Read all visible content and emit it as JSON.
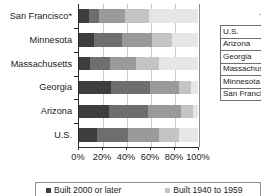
{
  "chart_data": {
    "type": "bar",
    "title": "",
    "subtitle": "",
    "orientation": "horizontal",
    "stacked": true,
    "normalized": true,
    "xlabel": "",
    "ylabel": "",
    "xlim": [
      0,
      100
    ],
    "grid": true,
    "grid_axis": "x",
    "legend_position": "bottom",
    "categories": [
      "San Francisco*",
      "Minnesota",
      "Massachusetts",
      "Georgia",
      "Arizona",
      "U.S."
    ],
    "xticks": [
      0,
      20,
      40,
      60,
      80,
      100
    ],
    "xticklabels": [
      "0%",
      "20%",
      "40%",
      "60%",
      "80%",
      "100%"
    ],
    "series": [
      {
        "name": "Built 2000 or later",
        "color": "#3d3d3d",
        "values": [
          8,
          13,
          9,
          27,
          25,
          15
        ]
      },
      {
        "name": "Built 1980 to 1999",
        "color": "#6e6e6e",
        "values": [
          9,
          23,
          17,
          33,
          33,
          26
        ]
      },
      {
        "name": "Built 1960 to 1979",
        "color": "#9a9a9a",
        "values": [
          22,
          25,
          22,
          24,
          28,
          26
        ]
      },
      {
        "name": "Built 1940 to 1959",
        "color": "#c4c4c4",
        "values": [
          20,
          17,
          19,
          10,
          10,
          17
        ]
      },
      {
        "name": "Built 1939 or earlier",
        "color": "#e6e6e6",
        "values": [
          41,
          22,
          33,
          6,
          4,
          16
        ]
      }
    ]
  },
  "legend": {
    "items": [
      {
        "label": "Built 2000 or later",
        "color": "#3d3d3d"
      },
      {
        "label": "Built 1940 to 1959",
        "color": "#c4c4c4"
      }
    ]
  },
  "table_panel": {
    "title": "T",
    "rows": [
      {
        "name": "U.S."
      },
      {
        "name": "Arizona"
      },
      {
        "name": "Georgia"
      },
      {
        "name": "Massachusetts"
      },
      {
        "name": "Minnesota"
      },
      {
        "name": "San Francisco*"
      }
    ]
  }
}
